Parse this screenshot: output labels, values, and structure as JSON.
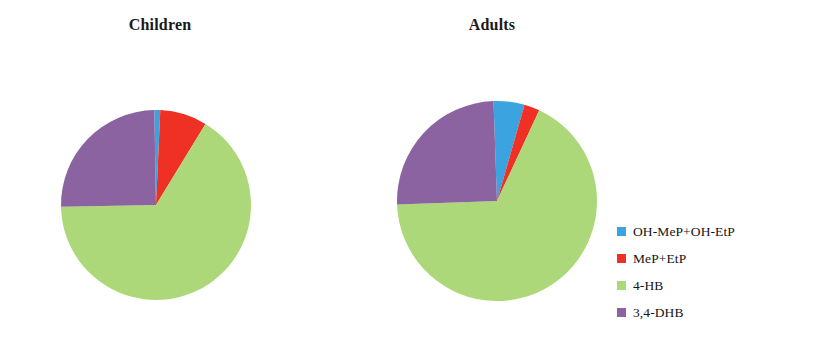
{
  "figure": {
    "background": "#ffffff",
    "width": 817,
    "height": 349
  },
  "legend": {
    "position": "right",
    "entries": [
      {
        "label": "OH-MeP+OH-EtP",
        "color": "#3BA3E0",
        "swatch_name": "legend-swatch-oh-mep-oh-etp"
      },
      {
        "label": "MeP+EtP",
        "color": "#EE3124",
        "swatch_name": "legend-swatch-mep-etp"
      },
      {
        "label": "4-HB",
        "color": "#ADD87A",
        "swatch_name": "legend-swatch-4-hb"
      },
      {
        "label": "3,4-DHB",
        "color": "#8A63A0",
        "swatch_name": "legend-swatch-34-dhb"
      }
    ]
  },
  "chart_data": [
    {
      "type": "pie",
      "title": "Children",
      "labels": [
        "OH-MeP+OH-EtP",
        "MeP+EtP",
        "4-HB",
        "3,4-DHB"
      ],
      "values": [
        1,
        8,
        66,
        25
      ],
      "unit": "%",
      "colors": [
        "#3BA3E0",
        "#EE3124",
        "#ADD87A",
        "#8A63A0"
      ],
      "start_angle_deg": -1,
      "direction": "clockwise",
      "radius_px": 95,
      "center_px": [
        156,
        205
      ],
      "grid": false,
      "xlabel": "",
      "ylabel": ""
    },
    {
      "type": "pie",
      "title": "Adults",
      "labels": [
        "OH-MeP+OH-EtP",
        "MeP+EtP",
        "4-HB",
        "3,4-DHB"
      ],
      "values": [
        5,
        2.5,
        67.5,
        25
      ],
      "unit": "%",
      "colors": [
        "#3BA3E0",
        "#EE3124",
        "#ADD87A",
        "#8A63A0"
      ],
      "start_angle_deg": -2,
      "direction": "clockwise",
      "radius_px": 100,
      "center_px": [
        497,
        201
      ],
      "grid": false,
      "xlabel": "",
      "ylabel": ""
    }
  ]
}
